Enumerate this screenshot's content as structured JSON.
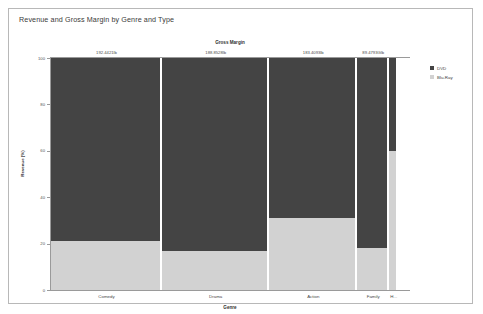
{
  "panel": {
    "title": "Revenue and Gross Margin by Genre and Type"
  },
  "legend": {
    "position": "right",
    "items": [
      {
        "label": "DVD",
        "color": "#444444"
      },
      {
        "label": "Blu-Ray",
        "color": "#d2d2d2"
      }
    ]
  },
  "chart_data": {
    "type": "bar",
    "subtype": "mosaic",
    "title": "Revenue and Gross Margin by Genre and Type",
    "column_axis_title": "Gross Margin",
    "xlabel": "Genre",
    "ylabel": "Revenue (%)",
    "ylim": [
      0,
      100
    ],
    "yticks": [
      0,
      20,
      40,
      60,
      80,
      100
    ],
    "ytick_labels": [
      "0",
      "20",
      "40",
      "60",
      "80",
      "100"
    ],
    "grid": false,
    "categories": [
      "Comedy",
      "Drama",
      "Action",
      "Family",
      "H..."
    ],
    "column_headers": [
      "192.4421lb",
      "188.8528lb",
      "183.4093lb",
      "89.4793Glb"
    ],
    "column_widths_pct": [
      31.0,
      30.0,
      24.5,
      9.0,
      2.5
    ],
    "series": [
      {
        "name": "DVD",
        "color": "#444444",
        "values": [
          79,
          83,
          69,
          82,
          40
        ]
      },
      {
        "name": "Blu-Ray",
        "color": "#d2d2d2",
        "values": [
          21,
          17,
          31,
          18,
          60
        ]
      }
    ]
  }
}
